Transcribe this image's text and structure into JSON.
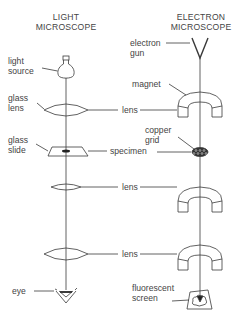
{
  "headers": {
    "light": {
      "line1": "LIGHT",
      "line2": "MICROSCOPE"
    },
    "electron": {
      "line1": "ELECTRON",
      "line2": "MICROSCOPE"
    }
  },
  "light_labels": {
    "light_source_1": "light",
    "light_source_2": "source",
    "glass_lens_1": "glass",
    "glass_lens_2": "lens",
    "glass_slide_1": "glass",
    "glass_slide_2": "slide",
    "eye": "eye"
  },
  "shared_labels": {
    "lens_1": "lens",
    "specimen": "specimen",
    "lens_2": "lens",
    "lens_3": "lens"
  },
  "electron_labels": {
    "electron_gun_1": "electron",
    "electron_gun_2": "gun",
    "magnet": "magnet",
    "copper_grid_1": "copper",
    "copper_grid_2": "grid",
    "fluorescent_screen_1": "fluorescent",
    "fluorescent_screen_2": "screen"
  },
  "colors": {
    "line": "#3a3a3a",
    "text": "#444444",
    "background": "#ffffff"
  }
}
